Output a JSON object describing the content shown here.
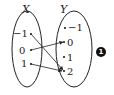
{
  "diagram": {
    "domain_set": {
      "label": "X",
      "elements": [
        "−1",
        "0",
        "1"
      ]
    },
    "codomain_set": {
      "label": "Y",
      "elements": [
        "−1",
        "0",
        "1",
        "2"
      ]
    },
    "mappings": [
      {
        "from": "−1",
        "to": "2"
      },
      {
        "from": "0",
        "to": "0"
      },
      {
        "from": "1",
        "to": "2"
      }
    ],
    "badge": "1",
    "colors": {
      "stroke": "#222222",
      "badge_bg": "#111111",
      "badge_fg": "#ffffff"
    }
  }
}
